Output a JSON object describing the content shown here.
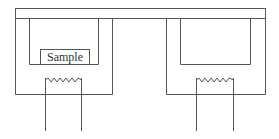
{
  "diagram": {
    "title": "",
    "labels": {
      "sample": "Sample"
    },
    "components": [
      {
        "id": "top-plate",
        "type": "bar"
      },
      {
        "id": "left-furnace",
        "type": "enclosure",
        "contains": [
          "left-crucible",
          "left-heater"
        ]
      },
      {
        "id": "left-crucible",
        "type": "container",
        "contains": [
          "sample"
        ]
      },
      {
        "id": "sample",
        "type": "sample",
        "label": "Sample"
      },
      {
        "id": "left-heater",
        "type": "heating-coil"
      },
      {
        "id": "right-furnace",
        "type": "enclosure",
        "contains": [
          "right-crucible",
          "right-heater"
        ]
      },
      {
        "id": "right-crucible",
        "type": "container"
      },
      {
        "id": "right-heater",
        "type": "heating-coil"
      }
    ],
    "line_color": "#555555",
    "background": "#ffffff"
  }
}
